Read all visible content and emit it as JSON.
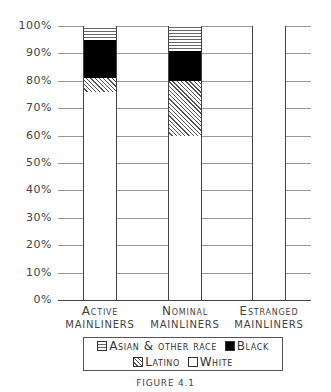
{
  "chart_data": {
    "type": "bar",
    "stacked": true,
    "title": "",
    "caption": "Figure 4.1",
    "xlabel": "",
    "ylabel": "",
    "ylim": [
      0,
      100
    ],
    "yticks": [
      "0%",
      "10%",
      "20%",
      "30%",
      "40%",
      "50%",
      "60%",
      "70%",
      "80%",
      "90%",
      "100%"
    ],
    "categories": [
      "Active mainliners",
      "Nominal mainliners",
      "Estranged mainliners"
    ],
    "series": [
      {
        "name": "White",
        "values": [
          76,
          60,
          100
        ]
      },
      {
        "name": "Latino",
        "values": [
          5,
          20,
          0
        ]
      },
      {
        "name": "Black",
        "values": [
          14,
          11,
          0
        ]
      },
      {
        "name": "Asian & other race",
        "values": [
          5,
          9,
          0
        ]
      }
    ],
    "grid": true,
    "legend_position": "bottom"
  },
  "axis": {
    "y_ticks": [
      "0%",
      "10%",
      "20%",
      "30%",
      "40%",
      "50%",
      "60%",
      "70%",
      "80%",
      "90%",
      "100%"
    ]
  },
  "labels": {
    "active_1": "Active",
    "active_2": "mainliners",
    "nominal_1": "Nominal",
    "nominal_2": "mainliners",
    "estranged_1": "Estranged",
    "estranged_2": "mainliners"
  },
  "legend": {
    "asian": "Asian & other race",
    "black": "Black",
    "latino": "Latino",
    "white": "White"
  },
  "caption": "FIGURE 4.1"
}
